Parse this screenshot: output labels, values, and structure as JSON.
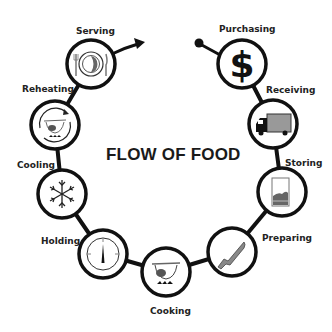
{
  "title": "FLOW OF FOOD",
  "steps": [
    {
      "label": "Purchasing",
      "icon": "dollar-sign-icon"
    },
    {
      "label": "Receiving",
      "icon": "delivery-truck-icon"
    },
    {
      "label": "Storing",
      "icon": "storage-container-icon"
    },
    {
      "label": "Preparing",
      "icon": "knife-icon"
    },
    {
      "label": "Cooking",
      "icon": "pot-on-flame-icon"
    },
    {
      "label": "Holding",
      "icon": "thermometer-gauge-icon"
    },
    {
      "label": "Cooling",
      "icon": "snowflake-icon"
    },
    {
      "label": "Reheating",
      "icon": "reheating-pot-icon"
    },
    {
      "label": "Serving",
      "icon": "plate-and-utensils-icon"
    }
  ],
  "colors": {
    "line": "#111111",
    "text": "#222222",
    "background": "#ffffff"
  }
}
